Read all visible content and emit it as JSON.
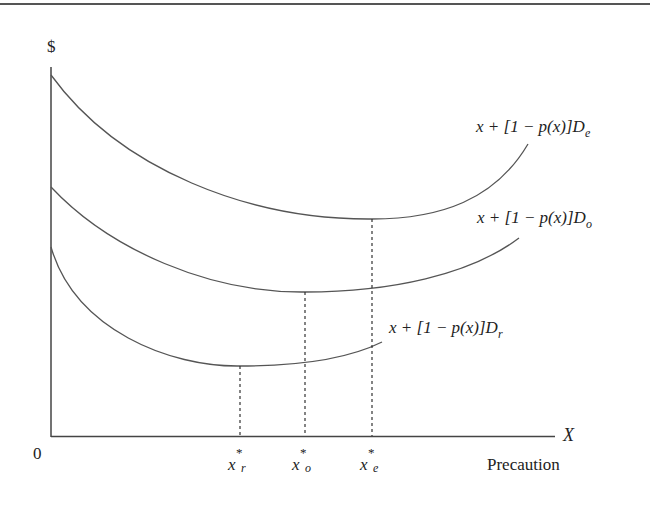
{
  "figure": {
    "y_axis_label": "$",
    "x_axis_label": "X",
    "x_axis_title": "Precaution",
    "origin_label": "0",
    "colors": {
      "line": "#555555",
      "text": "#222222",
      "background": "#ffffff"
    }
  },
  "curves": [
    {
      "id": "De",
      "label_main": "x + [1 − p(x)]D",
      "label_sub": "e"
    },
    {
      "id": "Do",
      "label_main": "x + [1 − p(x)]D",
      "label_sub": "o"
    },
    {
      "id": "Dr",
      "label_main": "x + [1 − p(x)]D",
      "label_sub": "r"
    }
  ],
  "markers": [
    {
      "id": "xr",
      "base": "x",
      "star": "*",
      "sub": "r"
    },
    {
      "id": "xo",
      "base": "x",
      "star": "*",
      "sub": "o"
    },
    {
      "id": "xe",
      "base": "x",
      "star": "*",
      "sub": "e"
    }
  ]
}
